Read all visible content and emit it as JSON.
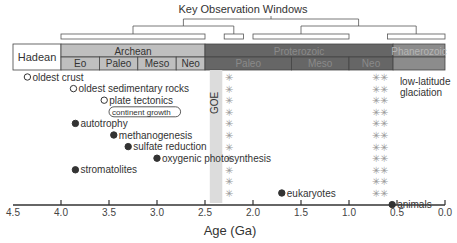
{
  "chart_data": {
    "type": "timeline",
    "title": "Key Observation Windows",
    "xlabel": "Age (Ga)",
    "xlim": [
      4.5,
      0.0
    ],
    "x_ticks": [
      4.5,
      4.0,
      3.5,
      3.0,
      2.5,
      2.0,
      1.5,
      1.0,
      0.5,
      0.0
    ],
    "x_tick_labels": [
      "4.5",
      "4.0",
      "3.5",
      "3.0",
      "2.5",
      "2.0",
      "1.5",
      "1.0",
      "0.5",
      "0.0"
    ],
    "observation_windows": [
      {
        "start": 4.0,
        "end": 2.5,
        "group": 1
      },
      {
        "start": 2.3,
        "end": 2.1,
        "group": 1
      },
      {
        "start": 2.0,
        "end": 1.0,
        "group": 2
      },
      {
        "start": 0.6,
        "end": 0.0,
        "group": 2
      }
    ],
    "eons": [
      {
        "name": "Hadean",
        "start": 4.5,
        "end": 4.0,
        "color": "#ffffff",
        "text_color": "#333333"
      },
      {
        "name": "Archean",
        "start": 4.0,
        "end": 2.5,
        "color": "#bfbfbf",
        "text_color": "#333333"
      },
      {
        "name": "Proterozoic",
        "start": 2.5,
        "end": 0.541,
        "color": "#666666",
        "text_color": "#8a8a8a"
      },
      {
        "name": "Phanerozoic",
        "start": 0.541,
        "end": 0.0,
        "color": "#8c8c8c",
        "text_color": "#b5b5b5"
      }
    ],
    "eras": [
      {
        "name": "Eo",
        "start": 4.0,
        "end": 3.6,
        "color": "#bfbfbf"
      },
      {
        "name": "Paleo",
        "start": 3.6,
        "end": 3.2,
        "color": "#bfbfbf"
      },
      {
        "name": "Meso",
        "start": 3.2,
        "end": 2.8,
        "color": "#bfbfbf"
      },
      {
        "name": "Neo",
        "start": 2.8,
        "end": 2.5,
        "color": "#bfbfbf"
      },
      {
        "name": "Paleo",
        "start": 2.5,
        "end": 1.6,
        "color": "#666666"
      },
      {
        "name": "Meso",
        "start": 1.6,
        "end": 1.0,
        "color": "#666666"
      },
      {
        "name": "Neo",
        "start": 1.0,
        "end": 0.541,
        "color": "#666666"
      },
      {
        "name": "",
        "start": 0.541,
        "end": 0.0,
        "color": "#8c8c8c"
      }
    ],
    "events": [
      {
        "label": "oldest crust",
        "age": 4.35,
        "marker": "open",
        "row": 0
      },
      {
        "label": "oldest sedimentary rocks",
        "age": 3.87,
        "marker": "open",
        "row": 1
      },
      {
        "label": "plate tectonics",
        "age": 3.55,
        "marker": "open",
        "row": 2
      },
      {
        "label": "continent growth",
        "age": 3.5,
        "marker": "box",
        "row": 3
      },
      {
        "label": "autotrophy",
        "age": 3.85,
        "marker": "filled",
        "row": 4
      },
      {
        "label": "methanogenesis",
        "age": 3.45,
        "marker": "filled",
        "row": 5
      },
      {
        "label": "sulfate reduction",
        "age": 3.3,
        "marker": "filled",
        "row": 6
      },
      {
        "label": "oxygenic photosynthesis",
        "age": 3.0,
        "marker": "filled",
        "row": 7
      },
      {
        "label": "stromatolites",
        "age": 3.85,
        "marker": "filled",
        "row": 8
      },
      {
        "label": "eukaryotes",
        "age": 1.7,
        "marker": "filled",
        "row": 10
      },
      {
        "label": "animals",
        "age": 0.55,
        "marker": "filled",
        "row": 11
      }
    ],
    "goe": {
      "label": "GOE",
      "start": 2.45,
      "end": 2.32,
      "color": "#dcdcdc"
    },
    "glaciations": [
      {
        "age": 2.32,
        "count": 11
      },
      {
        "age": 0.72,
        "count": 11
      },
      {
        "age": 0.64,
        "count": 11
      }
    ],
    "annotations": [
      {
        "text": "low-latitude",
        "age": 0.47,
        "row": 1
      },
      {
        "text": "glaciation",
        "age": 0.47,
        "row": 2
      }
    ],
    "colors": {
      "axis": "#333333",
      "text": "#333333",
      "marker_fill": "#333333",
      "snowflake": "#999999",
      "bracket": "#555555"
    }
  }
}
